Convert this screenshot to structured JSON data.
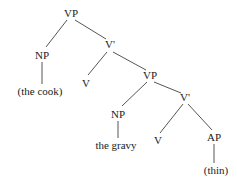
{
  "diagram": {
    "type": "syntax-tree",
    "nodes": [
      {
        "id": "vp1",
        "label": "VP",
        "x": 71,
        "y": 17
      },
      {
        "id": "np1",
        "label": "NP",
        "x": 42,
        "y": 59
      },
      {
        "id": "cook",
        "label": "(the cook)",
        "x": 40,
        "y": 95
      },
      {
        "id": "vbar1",
        "label": "V'",
        "x": 110,
        "y": 48
      },
      {
        "id": "v1",
        "label": "V",
        "x": 86,
        "y": 87
      },
      {
        "id": "vp2",
        "label": "VP",
        "x": 150,
        "y": 79
      },
      {
        "id": "np2",
        "label": "NP",
        "x": 118,
        "y": 118
      },
      {
        "id": "gravy",
        "label": "the gravy",
        "x": 116,
        "y": 149
      },
      {
        "id": "vbar2",
        "label": "V'",
        "x": 185,
        "y": 101
      },
      {
        "id": "v2",
        "label": "V",
        "x": 158,
        "y": 144
      },
      {
        "id": "ap",
        "label": "AP",
        "x": 214,
        "y": 141
      },
      {
        "id": "thin",
        "label": "(thin)",
        "x": 216,
        "y": 174
      }
    ],
    "edges": [
      {
        "from": "vp1",
        "to": "np1",
        "x1": 67,
        "y1": 20,
        "x2": 46,
        "y2": 47
      },
      {
        "from": "vp1",
        "to": "vbar1",
        "x1": 75,
        "y1": 20,
        "x2": 106,
        "y2": 39
      },
      {
        "from": "np1",
        "to": "cook",
        "x1": 42,
        "y1": 62,
        "x2": 42,
        "y2": 84
      },
      {
        "from": "vbar1",
        "to": "v1",
        "x1": 107,
        "y1": 52,
        "x2": 88,
        "y2": 75
      },
      {
        "from": "vbar1",
        "to": "vp2",
        "x1": 113,
        "y1": 52,
        "x2": 146,
        "y2": 70
      },
      {
        "from": "vp2",
        "to": "np2",
        "x1": 147,
        "y1": 82,
        "x2": 122,
        "y2": 106
      },
      {
        "from": "vp2",
        "to": "vbar2",
        "x1": 154,
        "y1": 82,
        "x2": 181,
        "y2": 93
      },
      {
        "from": "np2",
        "to": "gravy",
        "x1": 118,
        "y1": 121,
        "x2": 118,
        "y2": 138
      },
      {
        "from": "vbar2",
        "to": "v2",
        "x1": 183,
        "y1": 104,
        "x2": 160,
        "y2": 133
      },
      {
        "from": "vbar2",
        "to": "ap",
        "x1": 188,
        "y1": 104,
        "x2": 212,
        "y2": 130
      },
      {
        "from": "ap",
        "to": "thin",
        "x1": 214,
        "y1": 144,
        "x2": 214,
        "y2": 163
      }
    ]
  }
}
